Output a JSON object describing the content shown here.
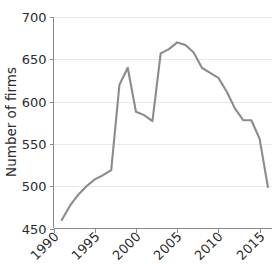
{
  "figure": {
    "width": 276,
    "height": 264,
    "background": "#ffffff"
  },
  "chart_data": {
    "type": "line",
    "title": "",
    "subtitle": "",
    "xlabel": "",
    "ylabel": "Number of firms",
    "xlim": [
      1990,
      2016.5
    ],
    "ylim": [
      450,
      700
    ],
    "grid": true,
    "grid_axis": "y",
    "legend": false,
    "legend_position": "none",
    "line_color": "#8c8c8c",
    "x_tick_labels": [
      "1990",
      "1995",
      "2000",
      "2005",
      "2010",
      "2015"
    ],
    "x_ticks": [
      1990,
      1995,
      2000,
      2005,
      2010,
      2015
    ],
    "y_tick_labels": [
      "450",
      "500",
      "550",
      "600",
      "650",
      "700"
    ],
    "y_ticks": [
      450,
      500,
      550,
      600,
      650,
      700
    ],
    "x_tick_rotation": 45,
    "series": [
      {
        "name": "Number of firms",
        "color": "#8c8c8c",
        "x": [
          1991,
          1992,
          1993,
          1994,
          1995,
          1996,
          1997,
          1998,
          1999,
          2000,
          2001,
          2002,
          2003,
          2004,
          2005,
          2006,
          2007,
          2008,
          2009,
          2010,
          2011,
          2012,
          2013,
          2014,
          2015,
          2016
        ],
        "values": [
          460,
          477,
          490,
          500,
          508,
          513,
          519,
          620,
          640,
          588,
          584,
          577,
          657,
          662,
          670,
          667,
          658,
          640,
          634,
          628,
          612,
          592,
          578,
          578,
          556,
          499
        ]
      }
    ],
    "annotations": []
  },
  "axes": {
    "y_axis_title": "Number of firms",
    "x_axis_title": ""
  }
}
